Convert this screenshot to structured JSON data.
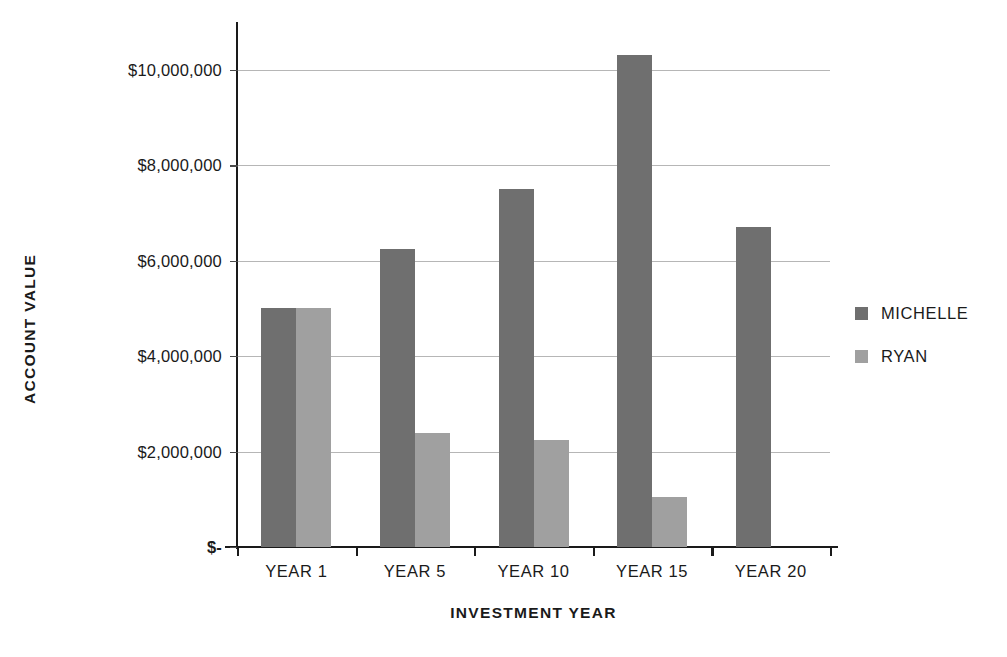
{
  "chart_data": {
    "type": "bar",
    "title": "",
    "xlabel": "INVESTMENT YEAR",
    "ylabel": "ACCOUNT VALUE",
    "categories": [
      "YEAR 1",
      "YEAR 5",
      "YEAR 10",
      "YEAR 15",
      "YEAR 20"
    ],
    "series": [
      {
        "name": "MICHELLE",
        "color": "#6f6f6f",
        "values": [
          5000000,
          6250000,
          7500000,
          10300000,
          6700000
        ]
      },
      {
        "name": "RYAN",
        "color": "#a0a0a0",
        "values": [
          5000000,
          2400000,
          2250000,
          1050000,
          0
        ]
      }
    ],
    "ylim": [
      0,
      11000000
    ],
    "ytick_values": [
      0,
      2000000,
      4000000,
      6000000,
      8000000,
      10000000
    ],
    "ytick_labels": [
      "$-",
      "$2,000,000",
      "$4,000,000",
      "$6,000,000",
      "$8,000,000",
      "$10,000,000"
    ],
    "grid": true,
    "grid_axis": "y",
    "legend_position": "right",
    "background": "#ffffff",
    "axis_color": "#1a1a1a",
    "gridline_color": "#9a9a9a"
  },
  "legend": {
    "entries": [
      {
        "label": "MICHELLE",
        "color": "#6f6f6f"
      },
      {
        "label": "RYAN",
        "color": "#a0a0a0"
      }
    ]
  },
  "axes": {
    "y_title": "ACCOUNT VALUE",
    "x_title": "INVESTMENT YEAR"
  }
}
